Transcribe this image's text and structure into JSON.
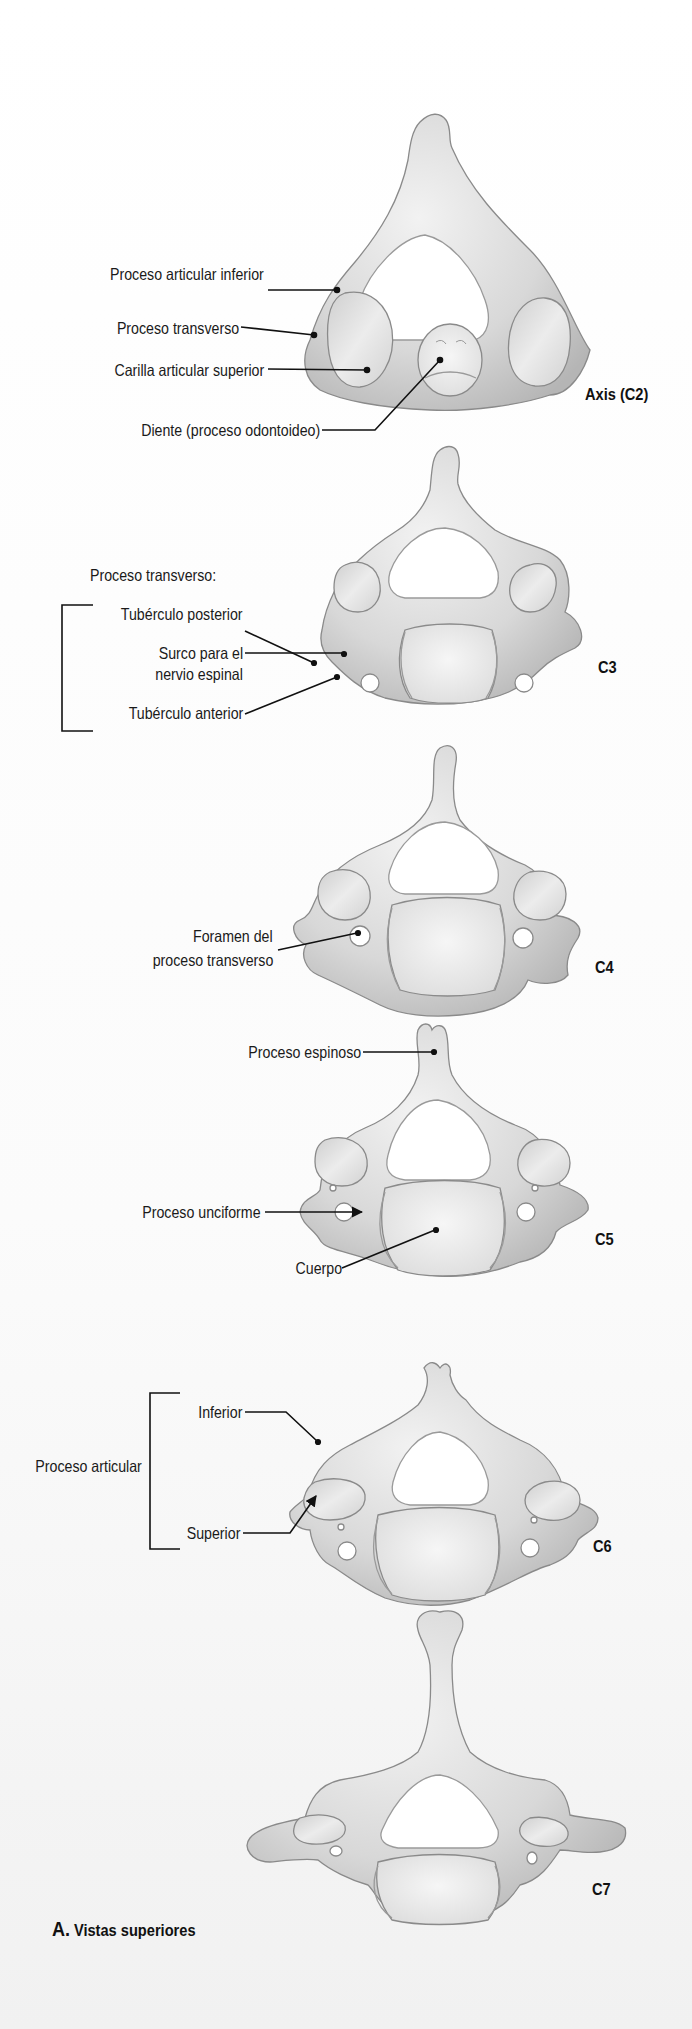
{
  "figure": {
    "caption": {
      "letter": "A.",
      "text": "Vistas superiores"
    },
    "colors": {
      "bone_fill": "#dedede",
      "bone_shade": "#bdbdbd",
      "bone_outline": "#8a8a8a",
      "facet_fill": "#e6e6e6",
      "body_fill": "#eeeeee",
      "leader_line": "#111111",
      "text": "#1a1a1a"
    },
    "vertebrae": [
      {
        "id": "c2",
        "name": "Axis (C2)",
        "labels": [
          "Proceso articular inferior",
          "Proceso transverso",
          "Carilla articular superior",
          "Diente (proceso odontoideo)"
        ]
      },
      {
        "id": "c3",
        "name": "C3",
        "group_heading": "Proceso transverso:",
        "labels": [
          "Tubérculo posterior",
          "Surco para el",
          "nervio espinal",
          "Tubérculo anterior"
        ]
      },
      {
        "id": "c4",
        "name": "C4",
        "labels": [
          "Foramen del",
          "proceso transverso"
        ]
      },
      {
        "id": "c5",
        "name": "C5",
        "labels": [
          "Proceso espinoso",
          "Proceso  unciforme",
          "Cuerpo"
        ]
      },
      {
        "id": "c6",
        "name": "C6",
        "group_heading": "Proceso articular",
        "labels": [
          "Inferior",
          "Superior"
        ]
      },
      {
        "id": "c7",
        "name": "C7",
        "labels": []
      }
    ]
  }
}
